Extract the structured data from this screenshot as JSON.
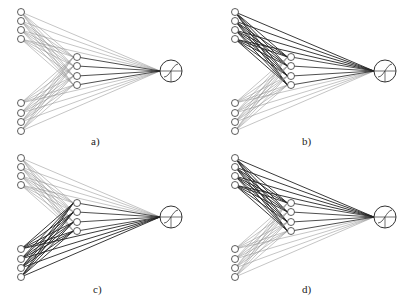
{
  "figure": {
    "panels": [
      {
        "id": "a",
        "caption": "a)",
        "ox": 0,
        "oy": 0,
        "bold_group": "none",
        "caption_x": 91,
        "caption_y": 135
      },
      {
        "id": "b",
        "caption": "b)",
        "ox": 214,
        "oy": 0,
        "bold_group": "top",
        "caption_x": 302,
        "caption_y": 135
      },
      {
        "id": "c",
        "caption": "c)",
        "ox": 0,
        "oy": 146,
        "bold_group": "bottom",
        "caption_x": 93,
        "caption_y": 283
      },
      {
        "id": "d",
        "caption": "d)",
        "ox": 214,
        "oy": 146,
        "bold_group": "top",
        "caption_x": 302,
        "caption_y": 283
      }
    ],
    "layout": {
      "input_x": 21,
      "input_top_y": [
        12,
        21,
        30,
        39
      ],
      "input_bottom_y": [
        103,
        113,
        122,
        131
      ],
      "hidden_x": 77,
      "hidden_y": [
        57,
        66,
        76,
        85
      ],
      "output_x": 171,
      "output_y": 71,
      "node_r": 3.5,
      "output_r": 11
    },
    "colors": {
      "line_light": "#8a8a8a",
      "line_dark": "#222222",
      "node_stroke": "#333333"
    },
    "output_symbol": "sigmoid-with-crosshair"
  }
}
